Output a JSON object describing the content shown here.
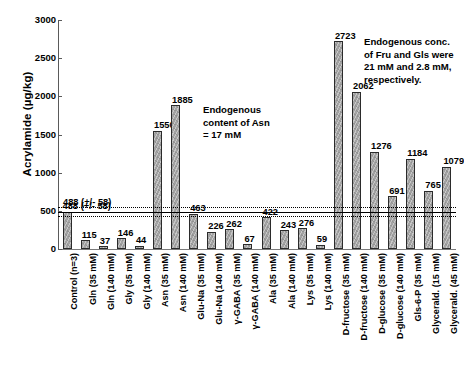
{
  "chart_data": {
    "type": "bar",
    "title": "",
    "xlabel": "",
    "ylabel": "Acrylamide (µg/kg)",
    "ylim": [
      0,
      3000
    ],
    "ytick_step": 500,
    "yticks": [
      "0",
      "500",
      "1000",
      "1500",
      "2000",
      "2500",
      "3000"
    ],
    "grid": false,
    "legend": "none",
    "bar_color": "#a3a3a3",
    "bar_edge_color": "#2b2b2b",
    "categories": [
      "Control (n=3)",
      "Gln (35 mM)",
      "Gln (140 mM)",
      "Gly (35 mM)",
      "Gly (140 mM)",
      "Asn (35 mM)",
      "Asn (140 mM)",
      "Glu-Na (35 mM)",
      "Glu-Na (140 mM)",
      "γ-GABA (35 mM)",
      "γ-GABA (140 mM)",
      "Ala (35 mM)",
      "Ala (140 mM)",
      "Lys (35 mM)",
      "Lys (140 mM)",
      "D-fructose (35 mM)",
      "D-fructose (140 mM)",
      "D-glucose (35 mM)",
      "D-glucose (140 mM)",
      "Gls-6-P (35 mM)",
      "Glycerald. (15 mM)",
      "Glycerald. (45 mM)"
    ],
    "values": [
      488,
      115,
      37,
      146,
      44,
      1550,
      1885,
      463,
      226,
      262,
      67,
      422,
      243,
      276,
      59,
      2723,
      2062,
      1276,
      691,
      1184,
      765,
      1079
    ],
    "value_labels": [
      "488 (+/- 58)",
      "115",
      "37",
      "146",
      "44",
      "1550",
      "1885",
      "463",
      "226",
      "262",
      "67",
      "422",
      "243",
      "276",
      "59",
      "2723",
      "2062",
      "1276",
      "691",
      "1184",
      "765",
      "1079"
    ],
    "reference_lines": {
      "mean": 488,
      "upper": 546,
      "lower": 430,
      "label": "488 (+/- 58)",
      "mean_style": "solid",
      "band_style": "dotted"
    },
    "annotations": [
      {
        "name": "asn-note",
        "text": "Endogenous\ncontent of Asn\n= 17 mM"
      },
      {
        "name": "sugar-note",
        "text": "Endogenous conc.\nof Fru and Gls were\n21 mM and 2.8 mM,\nrespectively."
      }
    ]
  }
}
